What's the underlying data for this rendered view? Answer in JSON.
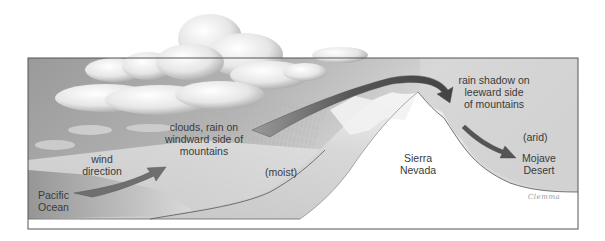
{
  "diagram": {
    "labels": {
      "pacific_ocean": [
        "Pacific",
        "Ocean"
      ],
      "wind_direction": [
        "wind",
        "direction"
      ],
      "windward": [
        "clouds, rain on",
        "windward side of",
        "mountains"
      ],
      "moist": "(moist)",
      "sierra_nevada": [
        "Sierra",
        "Nevada"
      ],
      "leeward": [
        "rain shadow on",
        "leeward side",
        "of mountains"
      ],
      "arid": "(arid)",
      "mojave_desert": [
        "Mojave",
        "Desert"
      ]
    },
    "signature": "Clemma",
    "colors": {
      "sky_dark": "#8f8f8f",
      "sky_light": "#dcdcdc",
      "ground_light": "#e6e6e6",
      "mountain_white": "#ffffff",
      "arrow": "#5a5a5a",
      "text": "#3a3a3a",
      "frame": "#555555"
    },
    "arrows": [
      {
        "name": "wind-arrow",
        "from": "Pacific Ocean",
        "to": "windward clouds"
      },
      {
        "name": "airflow-over-mountain-arrow",
        "from": "windward slope",
        "to": "leeward side"
      },
      {
        "name": "descending-air-arrow",
        "from": "leeward side",
        "to": "Mojave Desert"
      }
    ]
  }
}
